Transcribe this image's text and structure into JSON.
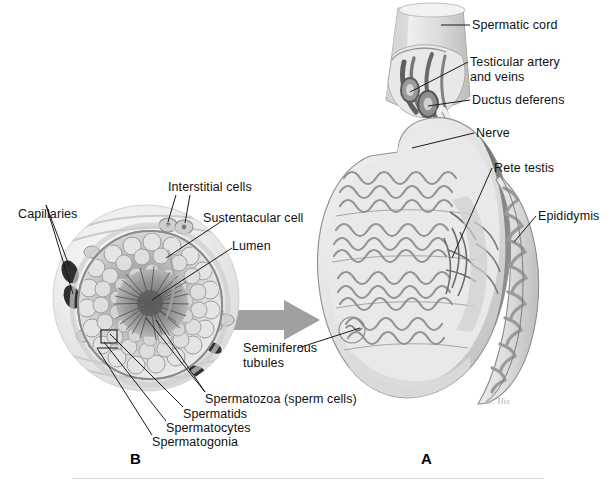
{
  "figure": {
    "background_color": "#ffffff",
    "ink_color": "#111111",
    "arrow_color": "#9a9a9a",
    "panels": [
      {
        "letter": "A",
        "name": "testis-sagittal-section"
      },
      {
        "letter": "B",
        "name": "seminiferous-tubule-cross-section"
      }
    ],
    "artist_signature": "G. Hix"
  },
  "panel_a": {
    "letter": "A",
    "labels": [
      {
        "id": "spermatic-cord",
        "text": "Spermatic cord"
      },
      {
        "id": "testicular-artery-and-veins",
        "text": "Testicular artery",
        "text2": "and veins"
      },
      {
        "id": "ductus-deferens",
        "text": "Ductus deferens"
      },
      {
        "id": "nerve",
        "text": "Nerve"
      },
      {
        "id": "rete-testis",
        "text": "Rete testis"
      },
      {
        "id": "epididymis",
        "text": "Epididymis"
      },
      {
        "id": "seminiferous-tubules",
        "text": "Seminiferous",
        "text2": "tubules"
      }
    ]
  },
  "panel_b": {
    "letter": "B",
    "labels": [
      {
        "id": "capillaries",
        "text": "Capillaries"
      },
      {
        "id": "interstitial-cells",
        "text": "Interstitial cells"
      },
      {
        "id": "sustentacular-cell",
        "text": "Sustentacular cell"
      },
      {
        "id": "lumen",
        "text": "Lumen"
      },
      {
        "id": "spermatozoa",
        "text": "Spermatozoa (sperm cells)"
      },
      {
        "id": "spermatids",
        "text": "Spermatids"
      },
      {
        "id": "spermatocytes",
        "text": "Spermatocytes"
      },
      {
        "id": "spermatogonia",
        "text": "Spermatogonia"
      }
    ]
  }
}
